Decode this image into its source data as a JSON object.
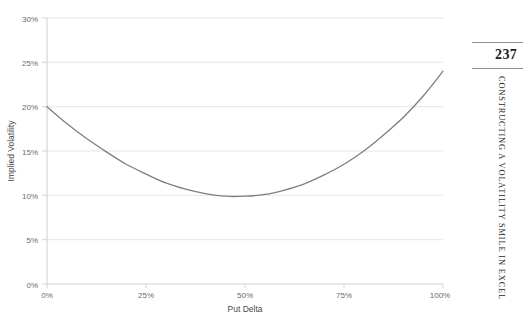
{
  "book": {
    "page_number": "237",
    "running_head": "CONSTRUCTING A VOLATILITY SMILE IN EXCEL"
  },
  "chart": {
    "title": "",
    "x_axis_label": "Put Delta",
    "y_axis_label": "Implied Volatility",
    "series_color": "#7f7f7f",
    "gridline_color": "#e8e8e8",
    "axis_color": "#d0d0d0",
    "tick_label_color": "#6b6b6b"
  },
  "chart_data": {
    "type": "line",
    "title": "",
    "xlabel": "Put Delta",
    "ylabel": "Implied Volatility",
    "xlim": [
      0,
      100
    ],
    "ylim": [
      0,
      30
    ],
    "grid": true,
    "legend": "none",
    "x_tick_labels": [
      "0%",
      "25%",
      "50%",
      "75%",
      "100%"
    ],
    "x_ticks": [
      0,
      25,
      50,
      75,
      100
    ],
    "y_tick_labels": [
      "0%",
      "5%",
      "10%",
      "15%",
      "20%",
      "25%",
      "30%"
    ],
    "y_ticks": [
      0,
      5,
      10,
      15,
      20,
      25,
      30
    ],
    "series": [
      {
        "name": "Implied Volatility Smile",
        "x": [
          0,
          5,
          10,
          15,
          20,
          25,
          30,
          35,
          40,
          45,
          50,
          55,
          60,
          65,
          70,
          75,
          80,
          85,
          90,
          95,
          100
        ],
        "y": [
          20.0,
          18.1,
          16.4,
          14.9,
          13.5,
          12.4,
          11.4,
          10.7,
          10.2,
          9.9,
          9.9,
          10.1,
          10.6,
          11.3,
          12.3,
          13.5,
          15.0,
          16.8,
          18.8,
          21.2,
          24.0
        ]
      }
    ],
    "annotations": {
      "minimum_x": 47,
      "minimum_y": 9.9,
      "left_endpoint_y": 20.0,
      "right_endpoint_y": 24.0
    }
  }
}
